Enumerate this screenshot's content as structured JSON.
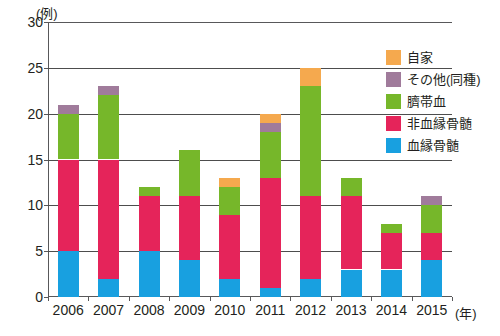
{
  "chart_data": {
    "type": "bar",
    "stacked": true,
    "title": "",
    "subtitle": "",
    "xlabel": "(年)",
    "ylabel": "(例)",
    "ylim": [
      0,
      30
    ],
    "ytick_step": 5,
    "ytick_labels": [
      "30",
      "25",
      "20",
      "15",
      "10",
      "5",
      "0"
    ],
    "grid": true,
    "legend_position": "right",
    "categories": [
      "2006",
      "2007",
      "2008",
      "2009",
      "2010",
      "2011",
      "2012",
      "2013",
      "2014",
      "2015"
    ],
    "series": [
      {
        "name": "血縁骨髄",
        "color": "#18A0E0",
        "values": [
          5,
          2,
          5,
          4,
          2,
          1,
          2,
          3,
          3,
          4
        ]
      },
      {
        "name": "非血縁骨髄",
        "color": "#E5245A",
        "values": [
          10,
          13,
          6,
          7,
          7,
          12,
          9,
          8,
          4,
          3
        ]
      },
      {
        "name": "臍帯血",
        "color": "#76B72A",
        "values": [
          5,
          7,
          1,
          5,
          3,
          5,
          12,
          2,
          1,
          3
        ]
      },
      {
        "name": "その他(同種)",
        "color": "#A07B9B",
        "values": [
          1,
          1,
          0,
          0,
          0,
          1,
          0,
          0,
          0,
          1
        ]
      },
      {
        "name": "自家",
        "color": "#F5A94E",
        "values": [
          0,
          0,
          0,
          0,
          1,
          1,
          2,
          0,
          0,
          0
        ]
      }
    ],
    "totals": [
      21,
      23,
      12,
      16,
      13,
      20,
      25,
      13,
      8,
      11
    ]
  },
  "legend": {
    "items": [
      {
        "label": "自家",
        "color": "#F5A94E"
      },
      {
        "label": "その他(同種)",
        "color": "#A07B9B"
      },
      {
        "label": "臍帯血",
        "color": "#76B72A"
      },
      {
        "label": "非血縁骨髄",
        "color": "#E5245A"
      },
      {
        "label": "血縁骨髄",
        "color": "#18A0E0"
      }
    ]
  },
  "axes": {
    "y_unit_label": "(例)",
    "x_unit_label": "(年)"
  }
}
